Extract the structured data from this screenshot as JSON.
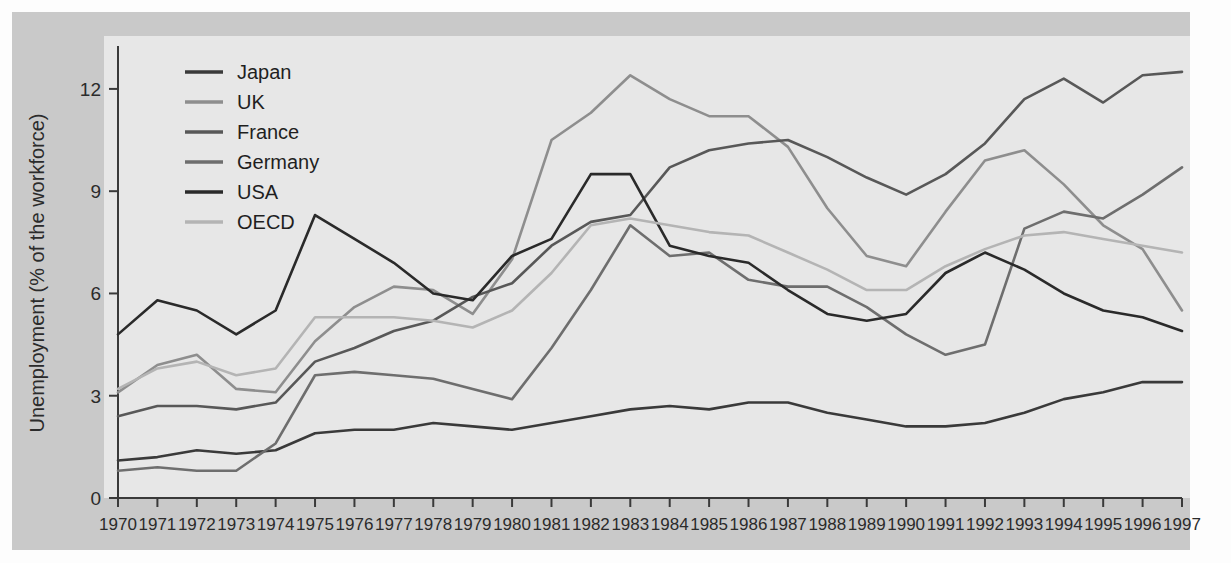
{
  "chart_data": {
    "type": "line",
    "title": "",
    "subtitle": "",
    "xlabel": "",
    "ylabel": "Unemployment (% of the workforce)",
    "x": [
      1970,
      1971,
      1972,
      1973,
      1974,
      1975,
      1976,
      1977,
      1978,
      1979,
      1980,
      1981,
      1982,
      1983,
      1984,
      1985,
      1986,
      1987,
      1988,
      1989,
      1990,
      1991,
      1992,
      1993,
      1994,
      1995,
      1996,
      1997
    ],
    "xtick_labels": [
      "1970",
      "1971",
      "1972",
      "1973",
      "1974",
      "1975",
      "1976",
      "1977",
      "1978",
      "1979",
      "1980",
      "1981",
      "1982",
      "1983",
      "1984",
      "1985",
      "1986",
      "1987",
      "1988",
      "1989",
      "1990",
      "1991",
      "1992",
      "1993",
      "1994",
      "1995",
      "1996",
      "1997"
    ],
    "ytick_labels": [
      "0",
      "3",
      "6",
      "9",
      "12"
    ],
    "yticks": [
      0,
      3,
      6,
      9,
      12
    ],
    "ylim": [
      0,
      13.2
    ],
    "xlim": [
      1970,
      1997
    ],
    "grid": false,
    "legend_position": "top-left",
    "series": [
      {
        "name": "Japan",
        "color": "#3a3a3a",
        "values": [
          1.1,
          1.2,
          1.4,
          1.3,
          1.4,
          1.9,
          2.0,
          2.0,
          2.2,
          2.1,
          2.0,
          2.2,
          2.4,
          2.6,
          2.7,
          2.6,
          2.8,
          2.8,
          2.5,
          2.3,
          2.1,
          2.1,
          2.2,
          2.5,
          2.9,
          3.1,
          3.4,
          3.4
        ]
      },
      {
        "name": "UK",
        "color": "#8e8e8e",
        "values": [
          3.1,
          3.9,
          4.2,
          3.2,
          3.1,
          4.6,
          5.6,
          6.2,
          6.1,
          5.4,
          7.0,
          10.5,
          11.3,
          12.4,
          11.7,
          11.2,
          11.2,
          10.3,
          8.5,
          7.1,
          6.8,
          8.4,
          9.9,
          10.2,
          9.2,
          8.0,
          7.3,
          5.5
        ]
      },
      {
        "name": "France",
        "color": "#585858",
        "values": [
          2.4,
          2.7,
          2.7,
          2.6,
          2.8,
          4.0,
          4.4,
          4.9,
          5.2,
          5.9,
          6.3,
          7.4,
          8.1,
          8.3,
          9.7,
          10.2,
          10.4,
          10.5,
          10.0,
          9.4,
          8.9,
          9.5,
          10.4,
          11.7,
          12.3,
          11.6,
          12.4,
          12.5
        ]
      },
      {
        "name": "Germany",
        "color": "#6e6e6e",
        "values": [
          0.8,
          0.9,
          0.8,
          0.8,
          1.6,
          3.6,
          3.7,
          3.6,
          3.5,
          3.2,
          2.9,
          4.4,
          6.1,
          8.0,
          7.1,
          7.2,
          6.4,
          6.2,
          6.2,
          5.6,
          4.8,
          4.2,
          4.5,
          7.9,
          8.4,
          8.2,
          8.9,
          9.7
        ]
      },
      {
        "name": "USA",
        "color": "#2a2a2a",
        "values": [
          4.8,
          5.8,
          5.5,
          4.8,
          5.5,
          8.3,
          7.6,
          6.9,
          6.0,
          5.8,
          7.1,
          7.6,
          9.5,
          9.5,
          7.4,
          7.1,
          6.9,
          6.1,
          5.4,
          5.2,
          5.4,
          6.6,
          7.2,
          6.7,
          6.0,
          5.5,
          5.3,
          4.9
        ]
      },
      {
        "name": "OECD",
        "color": "#b4b4b4",
        "values": [
          3.2,
          3.8,
          4.0,
          3.6,
          3.8,
          5.3,
          5.3,
          5.3,
          5.2,
          5.0,
          5.5,
          6.6,
          8.0,
          8.2,
          8.0,
          7.8,
          7.7,
          7.2,
          6.7,
          6.1,
          6.1,
          6.8,
          7.3,
          7.7,
          7.8,
          7.6,
          7.4,
          7.2
        ]
      }
    ]
  },
  "legend": {
    "entries": [
      {
        "label": "Japan"
      },
      {
        "label": "UK"
      },
      {
        "label": "France"
      },
      {
        "label": "Germany"
      },
      {
        "label": "USA"
      },
      {
        "label": "OECD"
      }
    ]
  },
  "colors": {
    "page_background": "#fdfdfd",
    "frame_background": "#c9c9c9",
    "panel_background": "#e7e7e7",
    "axis": "#3a3a3a",
    "text": "#2b2b2b"
  }
}
